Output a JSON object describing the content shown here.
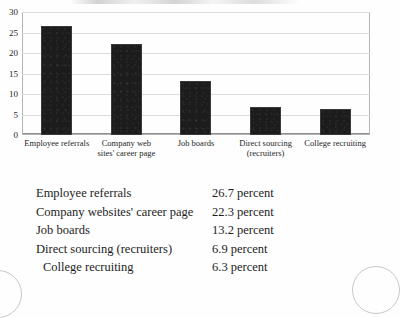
{
  "chart_data": {
    "type": "bar",
    "title": "",
    "xlabel": "",
    "ylabel": "",
    "ylim": [
      0,
      30
    ],
    "yticks": [
      "30",
      "25",
      "20",
      "15",
      "10",
      "5",
      "0"
    ],
    "grid": true,
    "legend": "none",
    "bar_color": "#1c1c1c",
    "categories": [
      "Employee referrals",
      "Company web sites' career page",
      "Job boards",
      "Direct sourcing (recruiters)",
      "College recruiting"
    ],
    "category_lines": [
      [
        "Employee referrals"
      ],
      [
        "Company web",
        "sites' career page"
      ],
      [
        "Job boards"
      ],
      [
        "Direct sourcing",
        "(recruiters)"
      ],
      [
        "College recruiting"
      ]
    ],
    "values": [
      26.7,
      22.3,
      13.2,
      6.9,
      6.3
    ]
  },
  "table": {
    "rows": [
      {
        "label": "Employee referrals",
        "value": "26.7 percent",
        "indent": false
      },
      {
        "label": "Company websites' career page",
        "value": "22.3 percent",
        "indent": false
      },
      {
        "label": "Job boards",
        "value": "13.2 percent",
        "indent": false
      },
      {
        "label": "Direct sourcing (recruiters)",
        "value": "6.9 percent",
        "indent": false
      },
      {
        "label": "College recruiting",
        "value": "6.3 percent",
        "indent": true
      }
    ]
  }
}
